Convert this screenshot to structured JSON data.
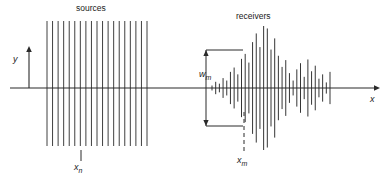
{
  "figure": {
    "type": "seismic-survey-geometry-diagram",
    "background_color": "#ffffff",
    "stroke_color": "#2a2a2a",
    "width": 390,
    "height": 180
  },
  "axes": {
    "x_axis": {
      "label": "x",
      "y_position": 88,
      "x_start": 10,
      "x_end": 374,
      "arrow": "right",
      "label_x": 370,
      "label_y": 94
    },
    "y_axis": {
      "label": "y",
      "x_position": 29,
      "y_start": 88,
      "y_end": 52,
      "arrow": "up",
      "label_x": 13,
      "label_y": 54
    }
  },
  "groups": {
    "sources": {
      "title": "sources",
      "title_x": 76,
      "title_y": 3,
      "count": 19,
      "x_start": 47,
      "x_end": 147,
      "top_y": 21,
      "bottom_y": 146,
      "annotation": {
        "label": "x",
        "subscript": "n",
        "tick_x": 81,
        "tick_y_top": 150,
        "tick_y_bottom": 161,
        "label_x": 74,
        "label_y": 162
      }
    },
    "receivers": {
      "title": "receivers",
      "title_x": 236,
      "title_y": 11,
      "count": 33,
      "x_start": 212,
      "x_end": 330,
      "trace_amplitudes": [
        0.04,
        0.1,
        0.07,
        0.16,
        0.12,
        0.26,
        0.33,
        0.22,
        0.47,
        0.55,
        0.41,
        0.74,
        0.88,
        0.66,
        1.0,
        0.96,
        0.62,
        0.8,
        0.52,
        0.34,
        0.45,
        0.24,
        0.12,
        0.3,
        0.4,
        0.18,
        0.46,
        0.27,
        0.36,
        0.15,
        0.22,
        0.09,
        0.26
      ],
      "max_half_height": 62,
      "annotation_wm": {
        "label": "w",
        "subscript": "m",
        "bracket_x": 206,
        "bracket_top_y": 50,
        "bracket_bottom_y": 126,
        "bracket_extent_x": 243,
        "label_x": 199,
        "label_y": 69
      },
      "annotation_xm": {
        "label": "x",
        "subscript": "m",
        "dash_x": 244,
        "dash_y_top": 112,
        "dash_y_bottom": 152,
        "label_x": 237,
        "label_y": 155
      }
    }
  }
}
